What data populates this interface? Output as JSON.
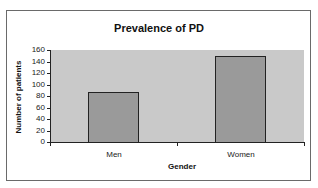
{
  "chart_data": {
    "type": "bar",
    "title": "Prevalence of PD",
    "xlabel": "Gender",
    "ylabel": "Number of patients",
    "categories": [
      "Men",
      "Women"
    ],
    "values": [
      87,
      150
    ],
    "ylim": [
      0,
      160
    ],
    "yticks": [
      0,
      20,
      40,
      60,
      80,
      100,
      120,
      140,
      160
    ],
    "grid": false,
    "legend": null,
    "colors": {
      "bar": "#9a9a9a",
      "plot_background": "#c9c9c9",
      "border": "#222222"
    }
  }
}
